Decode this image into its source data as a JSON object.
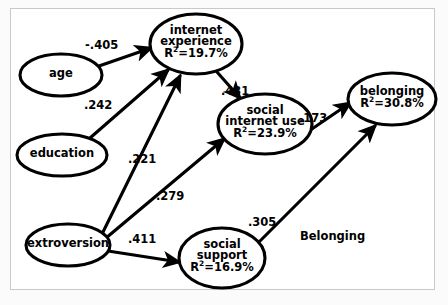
{
  "figure": {
    "type": "path-diagram",
    "caption_text": "Belonging",
    "background_color": "#ffffff",
    "stroke_color": "#000000"
  },
  "nodes": [
    {
      "id": "age",
      "name": "age",
      "line1": "age",
      "line2": "",
      "r2": "",
      "cx": 61,
      "cy": 75,
      "rx": 41,
      "ry": 21
    },
    {
      "id": "education",
      "name": "education",
      "line1": "education",
      "line2": "",
      "r2": "",
      "cx": 62,
      "cy": 155,
      "rx": 45,
      "ry": 21
    },
    {
      "id": "extroversion",
      "name": "extroversion",
      "line1": "extroversion",
      "line2": "",
      "r2": "",
      "cx": 68,
      "cy": 245,
      "rx": 42,
      "ry": 21
    },
    {
      "id": "internet-experience",
      "name": "internet experience",
      "line1": "internet",
      "line2": "experience",
      "r2": "19.7%",
      "cx": 196,
      "cy": 44,
      "rx": 46,
      "ry": 30
    },
    {
      "id": "social-internet-use",
      "name": "social internet use",
      "line1": "social",
      "line2": "internet use",
      "r2": "23.9%",
      "cx": 265,
      "cy": 124,
      "rx": 47,
      "ry": 30
    },
    {
      "id": "social-support",
      "name": "social support",
      "line1": "social",
      "line2": "support",
      "r2": "16.9%",
      "cx": 222,
      "cy": 258,
      "rx": 43,
      "ry": 30
    },
    {
      "id": "belonging",
      "name": "belonging",
      "line1": "belonging",
      "line2": "",
      "r2": "30.8%",
      "cx": 392,
      "cy": 99,
      "rx": 44,
      "ry": 26
    }
  ],
  "r2_prefix": "R",
  "r2_exponent": "2",
  "r2_equals": "=",
  "paths": [
    {
      "id": "age-to-internet-experience",
      "from": "age",
      "to": "internet experience",
      "coefficient": "-.405",
      "label_x": 85,
      "label_y": 38,
      "x1": 99,
      "y1": 66,
      "x2": 151,
      "y2": 48
    },
    {
      "id": "education-to-internet-experience",
      "from": "education",
      "to": "internet experience",
      "coefficient": ".242",
      "label_x": 84,
      "label_y": 98,
      "x1": 90,
      "y1": 138,
      "x2": 168,
      "y2": 70
    },
    {
      "id": "internet-experience-to-social-internet-use",
      "from": "internet experience",
      "to": "social internet use",
      "coefficient": ".431",
      "label_x": 221,
      "label_y": 84,
      "x1": 217,
      "y1": 72,
      "x2": 240,
      "y2": 98
    },
    {
      "id": "social-internet-use-to-belonging",
      "from": "social internet use",
      "to": "belonging",
      "coefficient": ".173",
      "label_x": 299,
      "label_y": 111,
      "x1": 306,
      "y1": 133,
      "x2": 350,
      "y2": 103
    },
    {
      "id": "extroversion-to-internet-experience",
      "from": "extroversion",
      "to": "internet experience",
      "coefficient": ".221",
      "label_x": 128,
      "label_y": 152,
      "x1": 103,
      "y1": 232,
      "x2": 180,
      "y2": 76
    },
    {
      "id": "extroversion-to-social-internet-use",
      "from": "extroversion",
      "to": "social internet use",
      "coefficient": ".279",
      "label_x": 156,
      "label_y": 189,
      "x1": 106,
      "y1": 238,
      "x2": 224,
      "y2": 139
    },
    {
      "id": "extroversion-to-social-support",
      "from": "extroversion",
      "to": "social support",
      "coefficient": ".411",
      "label_x": 128,
      "label_y": 232,
      "x1": 108,
      "y1": 251,
      "x2": 179,
      "y2": 262
    },
    {
      "id": "social-support-to-belonging",
      "from": "social support",
      "to": "belonging",
      "coefficient": ".305",
      "label_x": 248,
      "label_y": 215,
      "x1": 252,
      "y1": 249,
      "x2": 375,
      "y2": 126
    }
  ],
  "chart_data": {
    "type": "diagram",
    "title": "Belonging",
    "model": "structural equation / path model",
    "variance_explained": [
      {
        "variable": "internet experience",
        "r_squared_percent": 19.7
      },
      {
        "variable": "social internet use",
        "r_squared_percent": 23.9
      },
      {
        "variable": "social support",
        "r_squared_percent": 16.9
      },
      {
        "variable": "belonging",
        "r_squared_percent": 30.8
      }
    ],
    "path_coefficients": [
      {
        "from": "age",
        "to": "internet experience",
        "beta": -0.405
      },
      {
        "from": "education",
        "to": "internet experience",
        "beta": 0.242
      },
      {
        "from": "internet experience",
        "to": "social internet use",
        "beta": 0.431
      },
      {
        "from": "social internet use",
        "to": "belonging",
        "beta": 0.173
      },
      {
        "from": "extroversion",
        "to": "internet experience",
        "beta": 0.221
      },
      {
        "from": "extroversion",
        "to": "social internet use",
        "beta": 0.279
      },
      {
        "from": "extroversion",
        "to": "social support",
        "beta": 0.411
      },
      {
        "from": "social support",
        "to": "belonging",
        "beta": 0.305
      }
    ],
    "exogenous_variables": [
      "age",
      "education",
      "extroversion"
    ],
    "endogenous_variables": [
      "internet experience",
      "social internet use",
      "social support",
      "belonging"
    ]
  }
}
